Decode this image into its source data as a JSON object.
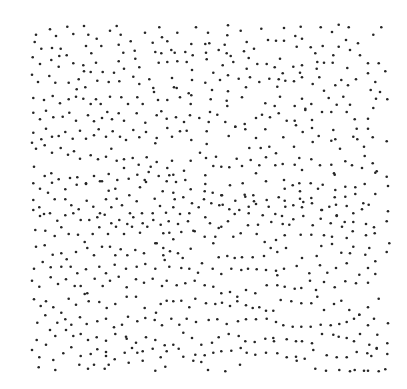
{
  "image": {
    "description": "Random-dot Glass pattern stimulus (dot field with an embedded concentric/swirl structure)",
    "background_color": "#ffffff",
    "dot_color": "#262626",
    "dot_count_approx": 700
  }
}
